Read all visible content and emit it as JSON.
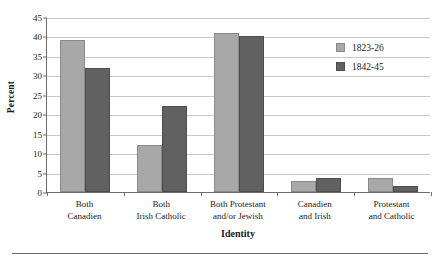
{
  "chart_data": {
    "type": "bar",
    "title": "",
    "xlabel": "Identity",
    "ylabel": "Percent",
    "categories": [
      "Both\nCanadien",
      "Both\nIrish Catholic",
      "Both Protestant\nand/or Jewish",
      "Canadien\nand Irish",
      "Protestant\nand Catholic"
    ],
    "category_lines": [
      [
        "Both",
        "Canadien"
      ],
      [
        "Both",
        "Irish Catholic"
      ],
      [
        "Both Protestant",
        "and/or Jewish"
      ],
      [
        "Canadien",
        "and Irish"
      ],
      [
        "Protestant",
        "and Catholic"
      ]
    ],
    "series": [
      {
        "name": "1823-26",
        "color": "#a8a8a8",
        "values": [
          39,
          12,
          41,
          2.8,
          3.6
        ]
      },
      {
        "name": "1842-45",
        "color": "#616161",
        "values": [
          32,
          22,
          40,
          3.7,
          1.5
        ]
      }
    ],
    "ylim": [
      0,
      45
    ],
    "ytick_step": 5,
    "yticks": [
      0,
      5,
      10,
      15,
      20,
      25,
      30,
      35,
      40,
      45
    ],
    "ytick_labels": [
      "0",
      "5",
      "10",
      "15",
      "20",
      "25",
      "30",
      "35",
      "40",
      "45"
    ],
    "grid": "horizontal",
    "legend_position": "upper right"
  },
  "legend": {
    "entries": [
      {
        "label": "1823-26"
      },
      {
        "label": "1842-45"
      }
    ]
  },
  "axes": {
    "x_title": "Identity",
    "y_title": "Percent"
  }
}
